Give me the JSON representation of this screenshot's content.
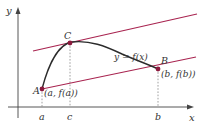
{
  "diagram": {
    "axes": {
      "x_label": "x",
      "y_label": "y"
    },
    "points": [
      {
        "id": "A",
        "label": "A",
        "coord_label": "(a, f(a))"
      },
      {
        "id": "B",
        "label": "B",
        "coord_label": "(b, f(b))"
      },
      {
        "id": "C",
        "label": "C",
        "coord_label": ""
      }
    ],
    "ticks": [
      {
        "label": "a"
      },
      {
        "label": "c"
      },
      {
        "label": "b"
      }
    ],
    "curve_label": "y = f(x)",
    "colors": {
      "curve": "#2b2b2b",
      "secant": "#a8234f",
      "tangent": "#a8234f",
      "point": "#8c1a3e",
      "axis": "#444444",
      "dashed": "#888888"
    }
  }
}
